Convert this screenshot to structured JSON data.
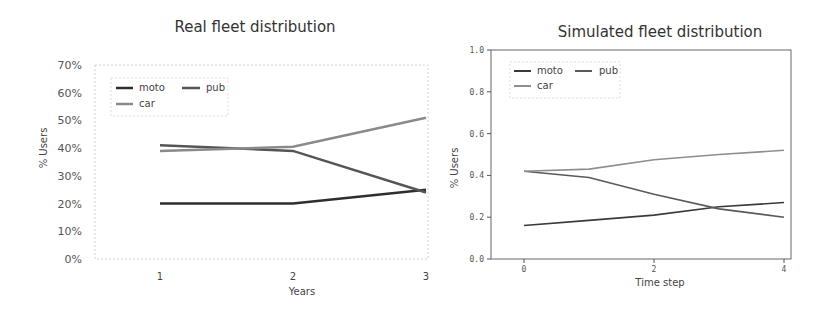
{
  "chart_data": [
    {
      "type": "line",
      "title": "Real fleet distribution",
      "xlabel": "Years",
      "ylabel": "% Users",
      "x": [
        1,
        2,
        3
      ],
      "x_ticks": [
        "1",
        "2",
        "3"
      ],
      "y_ticks": [
        "0%",
        "10%",
        "20%",
        "30%",
        "40%",
        "50%",
        "60%",
        "70%"
      ],
      "ylim": [
        0,
        70
      ],
      "grid": false,
      "legend_position": "upper left",
      "series": [
        {
          "name": "moto",
          "values": [
            20,
            20,
            25
          ],
          "color": "#2e2e2e"
        },
        {
          "name": "pub",
          "values": [
            41,
            39,
            24
          ],
          "color": "#555555"
        },
        {
          "name": "car",
          "values": [
            39,
            40.5,
            51
          ],
          "color": "#8a8a8a"
        }
      ]
    },
    {
      "type": "line",
      "title": "Simulated fleet distribution",
      "xlabel": "Time step",
      "ylabel": "% Users",
      "x": [
        0,
        1,
        2,
        3,
        4
      ],
      "x_ticks": [
        "0",
        "2",
        "4"
      ],
      "y_ticks": [
        "0.0",
        "0.2",
        "0.4",
        "0.6",
        "0.8",
        "1.0"
      ],
      "ylim": [
        0,
        1.0
      ],
      "grid": false,
      "legend_position": "upper left",
      "series": [
        {
          "name": "moto",
          "values": [
            0.16,
            0.185,
            0.21,
            0.25,
            0.27
          ],
          "color": "#3a3a3a"
        },
        {
          "name": "pub",
          "values": [
            0.42,
            0.39,
            0.31,
            0.24,
            0.2
          ],
          "color": "#5a5a5a"
        },
        {
          "name": "car",
          "values": [
            0.42,
            0.43,
            0.475,
            0.5,
            0.52
          ],
          "color": "#8e8e8e"
        }
      ]
    }
  ],
  "left": {
    "title": "Real fleet distribution",
    "xlabel": "Years",
    "ylabel": "% Users",
    "legend": {
      "moto": "moto",
      "pub": "pub",
      "car": "car"
    }
  },
  "right": {
    "title": "Simulated fleet distribution",
    "xlabel": "Time step",
    "ylabel": "% Users",
    "legend": {
      "moto": "moto",
      "pub": "pub",
      "car": "car"
    }
  }
}
